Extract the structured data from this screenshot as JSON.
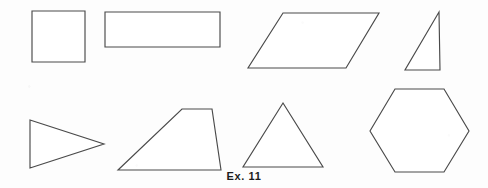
{
  "figure": {
    "caption": "Ex. 11",
    "width": 488,
    "height": 188,
    "background_color": "#fdfdfd",
    "stroke_color": "#4a4a4a",
    "fill_color": "#ffffff",
    "caption_color": "#1c1c1c"
  },
  "chart_data": {
    "type": "diagram",
    "title": "Ex. 11",
    "xlabel": "",
    "ylabel": "",
    "grid": false,
    "legend": "none",
    "coordinate_space": {
      "x": [
        0,
        488
      ],
      "y": [
        0,
        188
      ]
    },
    "rows": 2,
    "columns": 4,
    "shapes": [
      {
        "name": "square",
        "row": 1,
        "column": 1,
        "sides": 4,
        "points": "32,11 85,11 85,62 32,62",
        "bbox": [
          32,
          11,
          53,
          51
        ]
      },
      {
        "name": "rectangle",
        "row": 1,
        "column": 2,
        "sides": 4,
        "points": "105,12 220,12 220,47 105,47",
        "bbox": [
          105,
          12,
          115,
          35
        ]
      },
      {
        "name": "parallelogram",
        "row": 1,
        "column": 3,
        "sides": 4,
        "points": "283,13 379,13 346,68 248,68",
        "bbox": [
          248,
          13,
          131,
          55
        ]
      },
      {
        "name": "right-triangle",
        "row": 1,
        "column": 4,
        "sides": 3,
        "points": "439,12 440,70 405,70",
        "bbox": [
          405,
          12,
          35,
          58
        ]
      },
      {
        "name": "isosceles-triangle-pointing-right",
        "row": 2,
        "column": 1,
        "sides": 3,
        "points": "30,120 104,144 30,168",
        "bbox": [
          30,
          120,
          74,
          48
        ]
      },
      {
        "name": "trapezoid",
        "row": 2,
        "column": 2,
        "sides": 4,
        "points": "182,109 212,109 221,170 118,170",
        "bbox": [
          118,
          109,
          103,
          61
        ]
      },
      {
        "name": "isosceles-triangle",
        "row": 2,
        "column": 3,
        "sides": 3,
        "points": "283,103 323,167 243,167",
        "bbox": [
          243,
          103,
          80,
          64
        ]
      },
      {
        "name": "hexagon",
        "row": 2,
        "column": 4,
        "sides": 6,
        "points": "395,89 444,89 469,131 444,172 395,172 370,131",
        "bbox": [
          370,
          89,
          99,
          83
        ]
      }
    ]
  }
}
